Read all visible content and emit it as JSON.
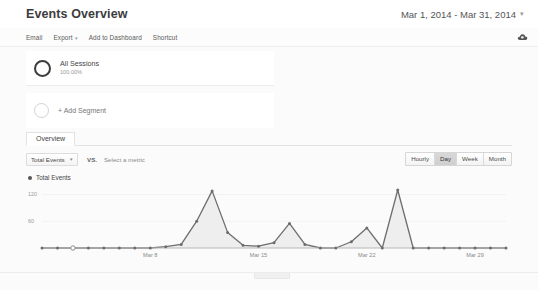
{
  "header": {
    "title": "Events Overview",
    "date_range": "Mar 1, 2014 - Mar 31, 2014",
    "date_caret": "▾"
  },
  "toolbar": {
    "email_label": "Email",
    "export_label": "Export",
    "export_caret": "▾",
    "add_to_dashboard_label": "Add to Dashboard",
    "shortcut_label": "Shortcut",
    "right_icon": "cloud-icon"
  },
  "segments": [
    {
      "name": "All Sessions",
      "percent": "100.00%"
    },
    {
      "name": "+ Add Segment",
      "percent": ""
    }
  ],
  "tabs": [
    {
      "label": "Overview",
      "active": true
    }
  ],
  "metric_bar": {
    "primary_metric": "Total Events",
    "primary_caret": "▾",
    "vs_label": "VS.",
    "secondary_metric_placeholder": "Select a metric",
    "granularity": [
      {
        "label": "Hourly",
        "active": false
      },
      {
        "label": "Day",
        "active": true
      },
      {
        "label": "Week",
        "active": false
      },
      {
        "label": "Month",
        "active": false
      }
    ]
  },
  "colors": {
    "line": "#6d6d6d",
    "fill": "#eeeeee",
    "axis": "#9a9a9a",
    "text": "#444444"
  },
  "chart_data": {
    "type": "area",
    "title": "Total Events",
    "legend": [
      "Total Events"
    ],
    "legend_position": "top-left",
    "xlabel": "",
    "ylabel": "",
    "ylim": [
      0,
      130
    ],
    "yticks": [
      60,
      120
    ],
    "grid": false,
    "xticks": [
      "Mar 8",
      "Mar 15",
      "Mar 22",
      "Mar 29"
    ],
    "xtick_indices": [
      7,
      14,
      21,
      28
    ],
    "x": [
      "Mar 1",
      "Mar 2",
      "Mar 3",
      "Mar 4",
      "Mar 5",
      "Mar 6",
      "Mar 7",
      "Mar 8",
      "Mar 9",
      "Mar 10",
      "Mar 11",
      "Mar 12",
      "Mar 13",
      "Mar 14",
      "Mar 15",
      "Mar 16",
      "Mar 17",
      "Mar 18",
      "Mar 19",
      "Mar 20",
      "Mar 21",
      "Mar 22",
      "Mar 23",
      "Mar 24",
      "Mar 25",
      "Mar 26",
      "Mar 27",
      "Mar 28",
      "Mar 29",
      "Mar 30",
      "Mar 31"
    ],
    "values": [
      0,
      0,
      0,
      0,
      0,
      0,
      0,
      0,
      3,
      8,
      60,
      128,
      35,
      6,
      4,
      12,
      55,
      8,
      0,
      0,
      14,
      45,
      0,
      130,
      0,
      0,
      0,
      0,
      0,
      0,
      0
    ],
    "highlighted_point_index": 2
  }
}
